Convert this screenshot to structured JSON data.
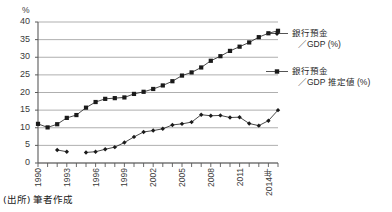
{
  "header": {
    "cropped_top_text": ""
  },
  "chart_data": {
    "type": "line",
    "title": "",
    "xlabel": "",
    "ylabel": "%",
    "ylim": [
      0,
      40
    ],
    "ytick_step": 5,
    "yticks": [
      "0",
      "5",
      "10",
      "15",
      "20",
      "25",
      "30",
      "35",
      "40"
    ],
    "xlim": [
      1990,
      2015
    ],
    "xticks": [
      "1990",
      "1993",
      "1996",
      "1999",
      "2002",
      "2005",
      "2008",
      "2011",
      "2014"
    ],
    "xtick_last_suffix": "年",
    "grid": true,
    "legend_position": "right",
    "x": [
      1990,
      1991,
      1992,
      1993,
      1994,
      1995,
      1996,
      1997,
      1998,
      1999,
      2000,
      2001,
      2002,
      2003,
      2004,
      2005,
      2006,
      2007,
      2008,
      2009,
      2010,
      2011,
      2012,
      2013,
      2014,
      2015
    ],
    "series": [
      {
        "name": "銀行預金／GDP 推定値 (%)",
        "name_line1": "銀行預金",
        "name_line2": "／GDP 推定値 (%)",
        "marker": "square",
        "color": "#1a1a1a",
        "values": [
          11.1,
          10.1,
          11.0,
          12.8,
          13.6,
          15.7,
          17.3,
          18.2,
          18.4,
          18.6,
          19.6,
          20.2,
          21.0,
          22.0,
          23.2,
          24.8,
          25.7,
          27.1,
          29.0,
          30.3,
          31.8,
          33.0,
          34.2,
          35.7,
          36.8,
          37.5
        ]
      },
      {
        "name": "銀行預金／GDP (%)",
        "name_line1": "銀行預金",
        "name_line2": "／GDP (%)",
        "marker": "diamond",
        "color": "#1a1a1a",
        "values": [
          null,
          null,
          3.7,
          3.2,
          null,
          3.0,
          3.2,
          3.9,
          4.5,
          5.8,
          7.4,
          8.8,
          9.2,
          9.7,
          10.8,
          11.1,
          11.6,
          13.7,
          13.4,
          13.5,
          12.9,
          13.0,
          11.2,
          10.6,
          12.0,
          13.3
        ]
      }
    ],
    "series_extra_point": {
      "note": "final diamond point",
      "x": 2015,
      "value": 15.0
    }
  },
  "legend": {
    "entries": [
      {
        "line1": "銀行預金",
        "line2": "／GDP (%)",
        "marker": "diamond"
      },
      {
        "line1": "銀行預金",
        "line2": "／GDP 推定値 (%)",
        "marker": "square"
      }
    ]
  },
  "footer": {
    "source": "(出所) 筆者作成"
  }
}
